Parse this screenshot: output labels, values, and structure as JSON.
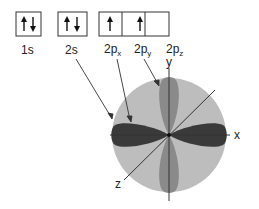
{
  "orbital_boxes": [
    {
      "label": "1s",
      "electrons": [
        "up",
        "down"
      ]
    },
    {
      "label": "2s",
      "electrons": [
        "up",
        "down"
      ]
    },
    {
      "label_main": "2p",
      "label_sub": "x",
      "electrons": [
        "up"
      ]
    },
    {
      "label_main": "2p",
      "label_sub": "y",
      "electrons": [
        "up"
      ]
    },
    {
      "label_main": "2p",
      "label_sub": "z",
      "electrons": []
    }
  ],
  "axes": {
    "x": "x",
    "y": "y",
    "z": "z"
  },
  "colors": {
    "sphere_2s": "#bdbdbd",
    "lobe_2px": "#3a3a3a",
    "lobe_2py": "#8a8a8a",
    "lines": "#333333"
  }
}
